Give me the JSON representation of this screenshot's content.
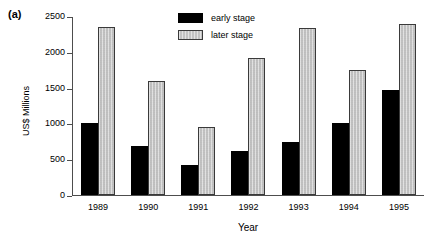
{
  "panel_label": "(a)",
  "chart_data": {
    "type": "bar",
    "title": "",
    "xlabel": "Year",
    "ylabel": "US$ Millions",
    "categories": [
      "1989",
      "1990",
      "1991",
      "1992",
      "1993",
      "1994",
      "1995"
    ],
    "series": [
      {
        "name": "early stage",
        "color": "#000000",
        "values": [
          1010,
          680,
          420,
          620,
          740,
          1010,
          1470
        ]
      },
      {
        "name": "later stage",
        "color": "#c9c9c9",
        "values": [
          2340,
          1590,
          950,
          1910,
          2330,
          1740,
          2390
        ]
      }
    ],
    "ylim": [
      0,
      2500
    ],
    "yticks": [
      0,
      500,
      1000,
      1500,
      2000,
      2500
    ],
    "ytick_labels": [
      "0",
      "500",
      "1000",
      "1500",
      "2000",
      "2500"
    ],
    "grid": false,
    "legend_position": "top-center"
  }
}
